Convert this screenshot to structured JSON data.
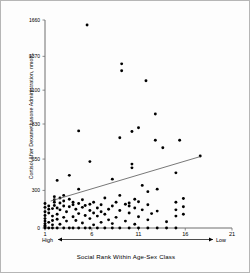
{
  "chart_data": {
    "type": "scatter",
    "title": "",
    "xlabel": "Social Rank Within Age-Sex Class",
    "ylabel": "Cortisol After Dexamethasone Administration, nmol/L",
    "xlim": [
      1,
      21
    ],
    "ylim": [
      0,
      1660
    ],
    "grid": false,
    "legend": null,
    "xticks": [
      "1",
      "6",
      "11",
      "16",
      "21"
    ],
    "xtick_values": [
      1,
      6,
      11,
      16,
      21
    ],
    "yticks": [
      "0",
      "300",
      "550",
      "830",
      "1100",
      "1370",
      "1660"
    ],
    "ytick_values": [
      0,
      300,
      550,
      830,
      1100,
      1370,
      1660
    ],
    "axis_endcap_left": "High",
    "axis_endcap_right": "Low",
    "annotations": [
      "Arrow from High (rank 1) to Low (rank 21) beneath x-axis"
    ],
    "series": [
      {
        "name": "Individuals",
        "marker": "filled-circle",
        "color": "#000000",
        "points": [
          [
            1,
            0
          ],
          [
            1,
            10
          ],
          [
            1,
            20
          ],
          [
            1,
            35
          ],
          [
            1,
            55
          ],
          [
            1,
            75
          ],
          [
            1,
            100
          ],
          [
            1,
            130
          ],
          [
            1,
            165
          ],
          [
            1,
            195
          ],
          [
            1.4,
            0
          ],
          [
            1.4,
            45
          ],
          [
            1.4,
            120
          ],
          [
            1.4,
            150
          ],
          [
            1.4,
            175
          ],
          [
            1.8,
            0
          ],
          [
            1.8,
            25
          ],
          [
            1.8,
            60
          ],
          [
            1.8,
            95
          ],
          [
            1.8,
            155
          ],
          [
            2,
            180
          ],
          [
            2,
            205
          ],
          [
            2,
            225
          ],
          [
            2,
            250
          ],
          [
            2.3,
            0
          ],
          [
            2.3,
            70
          ],
          [
            2.3,
            110
          ],
          [
            2.3,
            160
          ],
          [
            2.3,
            380
          ],
          [
            2.6,
            30
          ],
          [
            2.6,
            145
          ],
          [
            2.6,
            200
          ],
          [
            2.6,
            240
          ],
          [
            3,
            0
          ],
          [
            3,
            85
          ],
          [
            3,
            175
          ],
          [
            3,
            215
          ],
          [
            3,
            260
          ],
          [
            3.3,
            55
          ],
          [
            3.3,
            130
          ],
          [
            3.6,
            0
          ],
          [
            3.6,
            170
          ],
          [
            3.6,
            230
          ],
          [
            3.6,
            420
          ],
          [
            4,
            0
          ],
          [
            4,
            90
          ],
          [
            4,
            185
          ],
          [
            4,
            205
          ],
          [
            4.3,
            60
          ],
          [
            4.3,
            150
          ],
          [
            4.6,
            0
          ],
          [
            4.6,
            115
          ],
          [
            4.6,
            195
          ],
          [
            4.6,
            310
          ],
          [
            4.6,
            775
          ],
          [
            5,
            40
          ],
          [
            5,
            165
          ],
          [
            5,
            225
          ],
          [
            5.3,
            0
          ],
          [
            5.3,
            100
          ],
          [
            5.3,
            180
          ],
          [
            5.5,
            1620
          ],
          [
            5.8,
            0
          ],
          [
            5.8,
            75
          ],
          [
            5.8,
            140
          ],
          [
            5.8,
            190
          ],
          [
            5.8,
            530
          ],
          [
            6.2,
            25
          ],
          [
            6.2,
            120
          ],
          [
            6.2,
            205
          ],
          [
            6.6,
            0
          ],
          [
            6.6,
            95
          ],
          [
            6.6,
            160
          ],
          [
            7,
            45
          ],
          [
            7,
            130
          ],
          [
            7,
            185
          ],
          [
            7.4,
            0
          ],
          [
            7.4,
            110
          ],
          [
            7.4,
            240
          ],
          [
            7.8,
            65
          ],
          [
            7.8,
            150
          ],
          [
            8.2,
            0
          ],
          [
            8.2,
            35
          ],
          [
            8.2,
            175
          ],
          [
            8.2,
            390
          ],
          [
            8.6,
            85
          ],
          [
            8.6,
            205
          ],
          [
            9,
            0
          ],
          [
            9,
            140
          ],
          [
            9,
            260
          ],
          [
            9,
            720
          ],
          [
            9.2,
            1310
          ],
          [
            9.2,
            1255
          ],
          [
            9.6,
            55
          ],
          [
            9.6,
            190
          ],
          [
            10,
            0
          ],
          [
            10,
            120
          ],
          [
            10,
            175
          ],
          [
            10,
            200
          ],
          [
            10.3,
            510
          ],
          [
            10.3,
            480
          ],
          [
            10.3,
            770
          ],
          [
            10.6,
            30
          ],
          [
            10.6,
            160
          ],
          [
            10.6,
            230
          ],
          [
            11,
            0
          ],
          [
            11,
            90
          ],
          [
            11,
            210
          ],
          [
            11,
            800
          ],
          [
            11.4,
            145
          ],
          [
            11.4,
            340
          ],
          [
            11.8,
            1175
          ],
          [
            12,
            0
          ],
          [
            12,
            65
          ],
          [
            12,
            185
          ],
          [
            12,
            290
          ],
          [
            12.4,
            115
          ],
          [
            12.8,
            700
          ],
          [
            12.8,
            910
          ],
          [
            13,
            0
          ],
          [
            13,
            135
          ],
          [
            13,
            310
          ],
          [
            13.6,
            640
          ],
          [
            14,
            0
          ],
          [
            14,
            50
          ],
          [
            15,
            0
          ],
          [
            15,
            95
          ],
          [
            15,
            145
          ],
          [
            15,
            205
          ],
          [
            15,
            440
          ],
          [
            15.4,
            700
          ],
          [
            15.8,
            110
          ],
          [
            15.8,
            170
          ],
          [
            15.8,
            235
          ],
          [
            17.6,
            575
          ]
        ]
      }
    ],
    "trendline": {
      "type": "linear-fit",
      "x_start": 1.6,
      "y_start": 215,
      "x_end": 17.6,
      "y_end": 570,
      "color": "#555555"
    }
  }
}
